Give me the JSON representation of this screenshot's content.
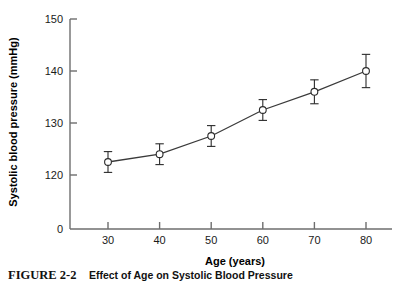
{
  "chart_data": {
    "type": "line",
    "title": "",
    "xlabel": "Age (years)",
    "ylabel": "Systolic blood pressure (mmHg)",
    "x": [
      30,
      40,
      50,
      60,
      70,
      80
    ],
    "values": [
      122.5,
      124.0,
      127.5,
      132.5,
      136.0,
      140.0
    ],
    "errors": [
      2.0,
      2.0,
      2.0,
      2.0,
      2.3,
      3.2
    ],
    "xticks": [
      "30",
      "40",
      "50",
      "60",
      "70",
      "80"
    ],
    "yticks": [
      "0",
      "120",
      "130",
      "140",
      "150"
    ],
    "xlim": [
      25,
      85
    ],
    "ylim": [
      118,
      151
    ],
    "grid": false,
    "legend": "none",
    "marker": "open-circle",
    "series_name": "Systolic blood pressure",
    "axis_break": true,
    "series": [
      {
        "name": "Systolic blood pressure",
        "values": [
          122.5,
          124.0,
          127.5,
          132.5,
          136.0,
          140.0
        ]
      }
    ],
    "points": [
      {
        "age": "30",
        "mean": "122.5",
        "err": "2.0"
      },
      {
        "age": "40",
        "mean": "124.0",
        "err": "2.0"
      },
      {
        "age": "50",
        "mean": "127.5",
        "err": "2.0"
      },
      {
        "age": "60",
        "mean": "132.5",
        "err": "2.0"
      },
      {
        "age": "70",
        "mean": "136.0",
        "err": "2.3"
      },
      {
        "age": "80",
        "mean": "140.0",
        "err": "3.2"
      }
    ],
    "colors": {
      "line": "#3a3a3a",
      "marker_stroke": "#2b2b2b",
      "marker_fill": "#ffffff",
      "axis": "#6e6e6e",
      "text": "#1a1a1a",
      "background": "#ffffff"
    }
  },
  "caption": {
    "label": "FIGURE 2-2",
    "text": "Effect of Age on Systolic Blood Pressure"
  }
}
